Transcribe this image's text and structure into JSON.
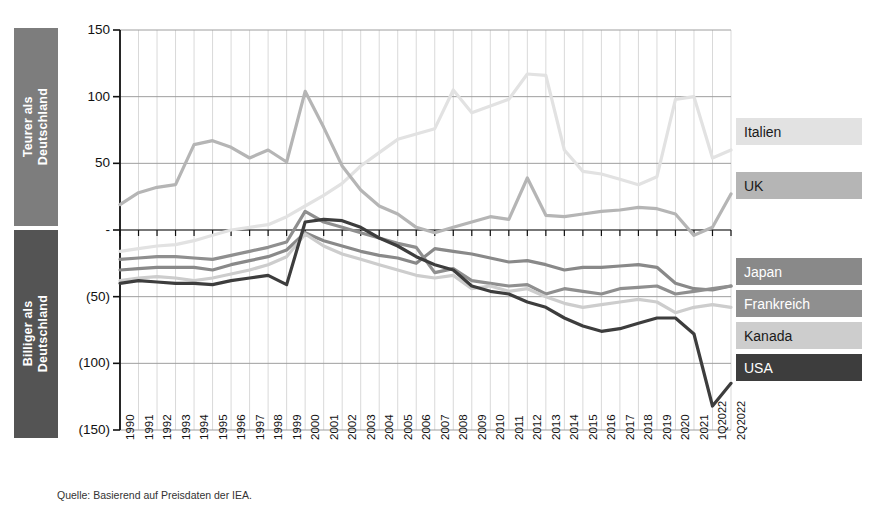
{
  "side_labels": {
    "expensive": "Teurer als\nDeutschland",
    "cheaper": "Billiger als\nDeutschland",
    "expensive_color": "#7d7d7d",
    "cheaper_color": "#545454"
  },
  "source": "Quelle: Basierend auf Preisdaten der IEA.",
  "legend": [
    {
      "label": "Italien",
      "swatch": "#e2e2e2",
      "text_color": "#1a1a1a"
    },
    {
      "label": "UK",
      "swatch": "#b5b5b5",
      "text_color": "#1a1a1a"
    },
    {
      "label": "Japan",
      "swatch": "#898989",
      "text_color": "#ffffff"
    },
    {
      "label": "Frankreich",
      "swatch": "#8f8f8f",
      "text_color": "#ffffff"
    },
    {
      "label": "Kanada",
      "swatch": "#cdcdcd",
      "text_color": "#1a1a1a"
    },
    {
      "label": "USA",
      "swatch": "#3d3d3d",
      "text_color": "#ffffff"
    }
  ],
  "chart_data": {
    "type": "line",
    "title": "",
    "subtitle": "",
    "xlabel": "",
    "ylabel": "",
    "grid": true,
    "legend_position": "right",
    "ylim": [
      -150,
      150
    ],
    "yticks": [
      150,
      100,
      50,
      0,
      -50,
      -100,
      -150
    ],
    "ytick_labels": [
      "150",
      "100",
      "50",
      "-",
      "(50)",
      "(100)",
      "(150)"
    ],
    "categories": [
      "1990",
      "1991",
      "1992",
      "1993",
      "1994",
      "1995",
      "1996",
      "1997",
      "1998",
      "1999",
      "2000",
      "2001",
      "2002",
      "2003",
      "2004",
      "2005",
      "2006",
      "2007",
      "2008",
      "2009",
      "2010",
      "2011",
      "2012",
      "2013",
      "2014",
      "2015",
      "2016",
      "2017",
      "2018",
      "2019",
      "2020",
      "2021",
      "1Q2022",
      "2Q2022"
    ],
    "series": [
      {
        "name": "Italien",
        "color": "#e2e2e2",
        "values": [
          -16,
          -14,
          -12,
          -11,
          -8,
          -4,
          0,
          2,
          4,
          10,
          18,
          26,
          35,
          48,
          58,
          68,
          72,
          76,
          105,
          88,
          93,
          98,
          117,
          116,
          60,
          44,
          42,
          38,
          34,
          40,
          98,
          100,
          54,
          60
        ]
      },
      {
        "name": "UK",
        "color": "#b5b5b5",
        "values": [
          19,
          28,
          32,
          34,
          64,
          67,
          62,
          54,
          60,
          51,
          104,
          77,
          48,
          30,
          18,
          12,
          2,
          -2,
          2,
          6,
          10,
          8,
          39,
          11,
          10,
          12,
          14,
          15,
          17,
          16,
          12,
          -4,
          2,
          27
        ]
      },
      {
        "name": "Japan",
        "color": "#898989",
        "values": [
          -30,
          -29,
          -28,
          -28,
          -28,
          -30,
          -26,
          -23,
          -20,
          -15,
          -2,
          -8,
          -12,
          -16,
          -19,
          -21,
          -25,
          -14,
          -16,
          -18,
          -21,
          -24,
          -23,
          -26,
          -30,
          -28,
          -28,
          -27,
          -26,
          -28,
          -40,
          -44,
          -45,
          -42
        ]
      },
      {
        "name": "Frankreich",
        "color": "#8f8f8f",
        "values": [
          -22,
          -21,
          -20,
          -20,
          -21,
          -22,
          -19,
          -16,
          -13,
          -9,
          14,
          6,
          2,
          -2,
          -6,
          -10,
          -13,
          -32,
          -29,
          -38,
          -40,
          -42,
          -41,
          -48,
          -44,
          -46,
          -48,
          -44,
          -43,
          -42,
          -48,
          -46,
          -44,
          -42
        ]
      },
      {
        "name": "Kanada",
        "color": "#cdcdcd",
        "values": [
          -38,
          -36,
          -35,
          -36,
          -38,
          -36,
          -33,
          -30,
          -26,
          -20,
          -3,
          -12,
          -18,
          -22,
          -26,
          -30,
          -34,
          -36,
          -34,
          -44,
          -42,
          -46,
          -44,
          -50,
          -55,
          -58,
          -56,
          -54,
          -52,
          -54,
          -62,
          -58,
          -56,
          -58
        ]
      },
      {
        "name": "USA",
        "color": "#3d3d3d",
        "values": [
          -40,
          -38,
          -39,
          -40,
          -40,
          -41,
          -38,
          -36,
          -34,
          -41,
          6,
          8,
          7,
          2,
          -6,
          -12,
          -20,
          -26,
          -30,
          -42,
          -46,
          -48,
          -54,
          -58,
          -66,
          -72,
          -76,
          -74,
          -70,
          -66,
          -66,
          -78,
          -132,
          -115
        ]
      }
    ]
  }
}
